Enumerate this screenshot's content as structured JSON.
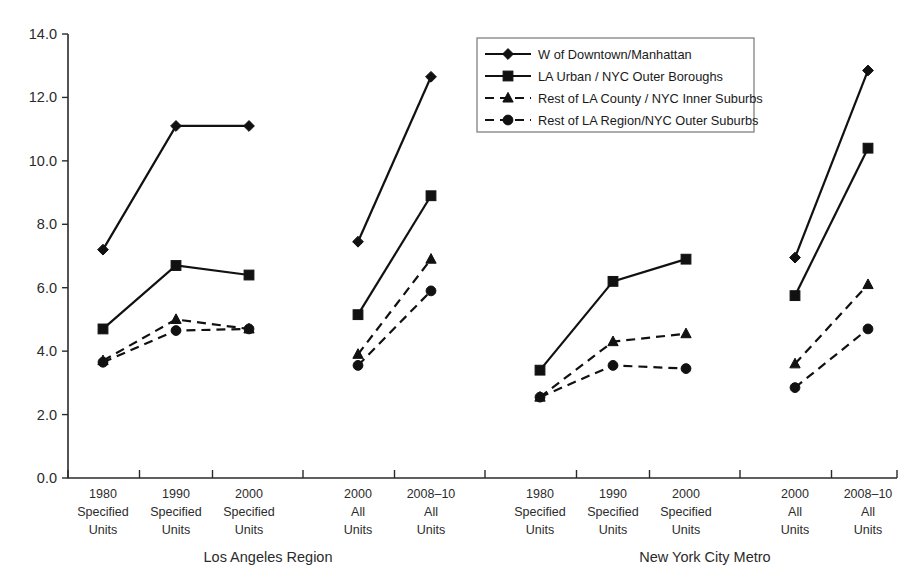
{
  "chart_data": {
    "type": "line",
    "title": "",
    "subtitle": "",
    "xlabel": "",
    "ylabel": "",
    "ylim": [
      0.0,
      14.0
    ],
    "ytick_step": 2.0,
    "grid": false,
    "legend_position": "top-center-right",
    "ytick_labels": [
      "0.0",
      "2.0",
      "4.0",
      "6.0",
      "8.0",
      "10.0",
      "12.0",
      "14.0"
    ],
    "ytick_values": [
      0.0,
      2.0,
      4.0,
      6.0,
      8.0,
      10.0,
      12.0,
      14.0
    ],
    "group_labels": [
      "Los Angeles Region",
      "New York City Metro"
    ],
    "categories": [
      {
        "year": "1980",
        "line2": "Specified",
        "line3": "Units",
        "group": "Los Angeles Region"
      },
      {
        "year": "1990",
        "line2": "Specified",
        "line3": "Units",
        "group": "Los Angeles Region"
      },
      {
        "year": "2000",
        "line2": "Specified",
        "line3": "Units",
        "group": "Los Angeles Region"
      },
      {
        "year": "2000",
        "line2": "All",
        "line3": "Units",
        "group": "Los Angeles Region"
      },
      {
        "year": "2008–10",
        "line2": "All",
        "line3": "Units",
        "group": "Los Angeles Region"
      },
      {
        "year": "1980",
        "line2": "Specified",
        "line3": "Units",
        "group": "New York City Metro"
      },
      {
        "year": "1990",
        "line2": "Specified",
        "line3": "Units",
        "group": "New York City Metro"
      },
      {
        "year": "2000",
        "line2": "Specified",
        "line3": "Units",
        "group": "New York City Metro"
      },
      {
        "year": "2000",
        "line2": "All",
        "line3": "Units",
        "group": "New York City Metro"
      },
      {
        "year": "2008–10",
        "line2": "All",
        "line3": "Units",
        "group": "New York City Metro"
      }
    ],
    "series": [
      {
        "name": "W of Downtown/Manhattan",
        "marker": "diamond",
        "dash": false,
        "values": [
          7.2,
          11.1,
          11.1,
          7.45,
          12.65,
          null,
          null,
          null,
          6.95,
          12.85
        ]
      },
      {
        "name": "LA Urban / NYC Outer Boroughs",
        "marker": "square",
        "dash": false,
        "values": [
          4.7,
          6.7,
          6.4,
          5.15,
          8.9,
          3.4,
          6.2,
          6.9,
          5.75,
          10.4
        ]
      },
      {
        "name": "Rest of LA County / NYC Inner Suburbs",
        "marker": "triangle",
        "dash": true,
        "values": [
          3.7,
          5.0,
          4.7,
          3.9,
          6.9,
          2.55,
          4.3,
          4.55,
          3.6,
          6.1
        ]
      },
      {
        "name": "Rest of LA Region/NYC Outer Suburbs",
        "marker": "circle",
        "dash": true,
        "values": [
          3.65,
          4.65,
          4.7,
          3.55,
          5.9,
          2.55,
          3.55,
          3.45,
          2.85,
          4.7
        ]
      }
    ],
    "colors": {
      "ink": "#111111",
      "axis": "#2b2b2b",
      "background": "#ffffff"
    }
  },
  "legend": {
    "items": [
      {
        "label": "W of Downtown/Manhattan",
        "marker": "diamond",
        "dash": false
      },
      {
        "label": "LA Urban / NYC Outer Boroughs",
        "marker": "square",
        "dash": false
      },
      {
        "label": "Rest of LA County / NYC Inner Suburbs",
        "marker": "triangle",
        "dash": true
      },
      {
        "label": "Rest of LA Region/NYC Outer Suburbs",
        "marker": "circle",
        "dash": true
      }
    ]
  }
}
